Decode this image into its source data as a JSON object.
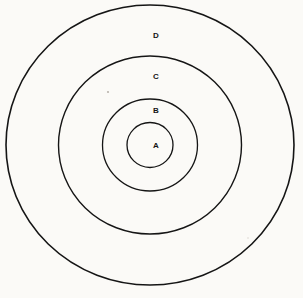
{
  "figure": {
    "kind": "concentric-circles-diagram",
    "background_color": "#fbfaf7",
    "ink_color": "#151515",
    "center": {
      "x": 150,
      "y": 145
    },
    "rings": [
      {
        "id": "ring-d",
        "label": "D",
        "order": 4,
        "position": "outermost",
        "radius_x": 144,
        "radius_y": 140,
        "stroke_width": 1.6,
        "label_x": 156,
        "label_y": 36
      },
      {
        "id": "ring-c",
        "label": "C",
        "order": 3,
        "position": "third",
        "radius_x": 91.5,
        "radius_y": 89,
        "stroke_width": 1.4,
        "label_x": 156,
        "label_y": 77
      },
      {
        "id": "ring-b",
        "label": "B",
        "order": 2,
        "position": "second",
        "radius_x": 47.5,
        "radius_y": 46,
        "stroke_width": 1.3,
        "label_x": 156,
        "label_y": 111
      },
      {
        "id": "ring-a",
        "label": "A",
        "order": 1,
        "position": "innermost",
        "radius_x": 23,
        "radius_y": 22.5,
        "stroke_width": 1.3,
        "label_x": 156,
        "label_y": 146
      }
    ],
    "specks": [
      {
        "x": 108,
        "y": 92,
        "r": 1.1
      },
      {
        "x": 248,
        "y": 238,
        "r": 0.8
      }
    ]
  },
  "chart_data": {
    "type": "diagram",
    "title": "",
    "subtype": "concentric-circles",
    "categories": [
      "A",
      "B",
      "C",
      "D"
    ],
    "values": [
      23,
      47.5,
      91.5,
      144
    ],
    "value_meaning": "outer radius in pixels of each labeled circle",
    "labels_inside_out": [
      "A",
      "B",
      "C",
      "D"
    ],
    "xlabel": "",
    "ylabel": "",
    "legend": "none",
    "grid": false
  }
}
